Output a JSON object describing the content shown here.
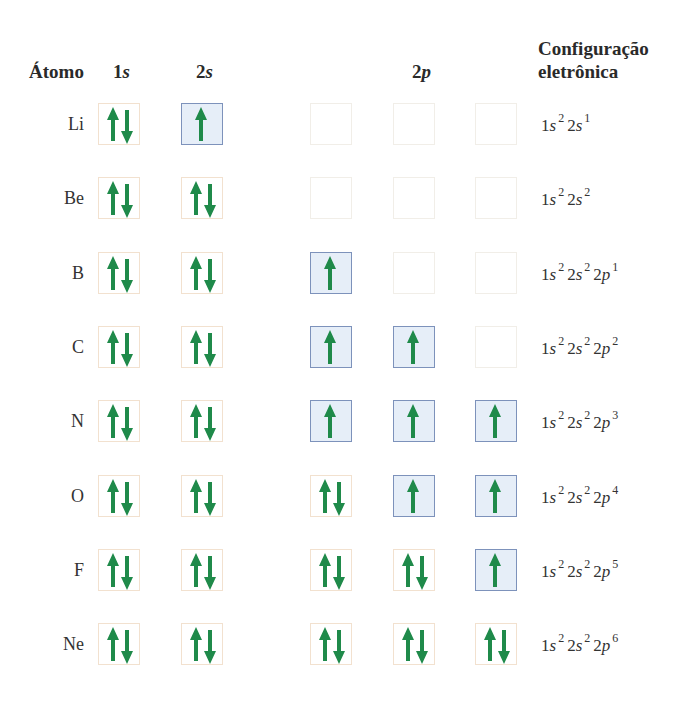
{
  "headers": {
    "atom": "Átomo",
    "orbital_1s": {
      "n": "1",
      "l": "s"
    },
    "orbital_2s": {
      "n": "2",
      "l": "s"
    },
    "orbital_2p": {
      "n": "2",
      "l": "p"
    },
    "config_line1": "Configuração",
    "config_line2": "eletrônica"
  },
  "colors": {
    "arrow": "#1f8a4a",
    "half_filled_fill": "#e6eef8",
    "half_filled_border": "#7d92bb",
    "full_border": "#f2e1cf",
    "empty_border": "#f1eee8"
  },
  "rows": [
    {
      "atom": "Li",
      "orbitals": [
        "full",
        "half",
        "empty",
        "empty",
        "empty"
      ],
      "config": [
        [
          "1",
          "s",
          "2"
        ],
        [
          "2",
          "s",
          "1"
        ]
      ]
    },
    {
      "atom": "Be",
      "orbitals": [
        "full",
        "full",
        "empty",
        "empty",
        "empty"
      ],
      "config": [
        [
          "1",
          "s",
          "2"
        ],
        [
          "2",
          "s",
          "2"
        ]
      ]
    },
    {
      "atom": "B",
      "orbitals": [
        "full",
        "full",
        "half",
        "empty",
        "empty"
      ],
      "config": [
        [
          "1",
          "s",
          "2"
        ],
        [
          "2",
          "s",
          "2"
        ],
        [
          "2",
          "p",
          "1"
        ]
      ]
    },
    {
      "atom": "C",
      "orbitals": [
        "full",
        "full",
        "half",
        "half",
        "empty"
      ],
      "config": [
        [
          "1",
          "s",
          "2"
        ],
        [
          "2",
          "s",
          "2"
        ],
        [
          "2",
          "p",
          "2"
        ]
      ]
    },
    {
      "atom": "N",
      "orbitals": [
        "full",
        "full",
        "half",
        "half",
        "half"
      ],
      "config": [
        [
          "1",
          "s",
          "2"
        ],
        [
          "2",
          "s",
          "2"
        ],
        [
          "2",
          "p",
          "3"
        ]
      ]
    },
    {
      "atom": "O",
      "orbitals": [
        "full",
        "full",
        "full",
        "half",
        "half"
      ],
      "config": [
        [
          "1",
          "s",
          "2"
        ],
        [
          "2",
          "s",
          "2"
        ],
        [
          "2",
          "p",
          "4"
        ]
      ]
    },
    {
      "atom": "F",
      "orbitals": [
        "full",
        "full",
        "full",
        "full",
        "half"
      ],
      "config": [
        [
          "1",
          "s",
          "2"
        ],
        [
          "2",
          "s",
          "2"
        ],
        [
          "2",
          "p",
          "5"
        ]
      ]
    },
    {
      "atom": "Ne",
      "orbitals": [
        "full",
        "full",
        "full",
        "full",
        "full"
      ],
      "config": [
        [
          "1",
          "s",
          "2"
        ],
        [
          "2",
          "s",
          "2"
        ],
        [
          "2",
          "p",
          "6"
        ]
      ]
    }
  ]
}
